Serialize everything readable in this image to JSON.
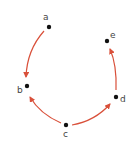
{
  "diagram": {
    "type": "directed-graph",
    "edge_color": "#d9503a",
    "node_color": "#111111",
    "label_color": "#444444",
    "nodes": [
      {
        "id": "a",
        "label": "a",
        "x": 49,
        "y": 27,
        "lx": 45,
        "ly": 20
      },
      {
        "id": "b",
        "label": "b",
        "x": 27,
        "y": 86,
        "lx": 17,
        "ly": 93
      },
      {
        "id": "c",
        "label": "c",
        "x": 66,
        "y": 125,
        "lx": 63,
        "ly": 136
      },
      {
        "id": "d",
        "label": "d",
        "x": 116,
        "y": 97,
        "lx": 120,
        "ly": 102
      },
      {
        "id": "e",
        "label": "e",
        "x": 107,
        "y": 41,
        "lx": 110,
        "ly": 38
      }
    ],
    "edges": [
      {
        "from": "a",
        "to": "b"
      },
      {
        "from": "c",
        "to": "b"
      },
      {
        "from": "c",
        "to": "d"
      },
      {
        "from": "d",
        "to": "e"
      }
    ]
  }
}
